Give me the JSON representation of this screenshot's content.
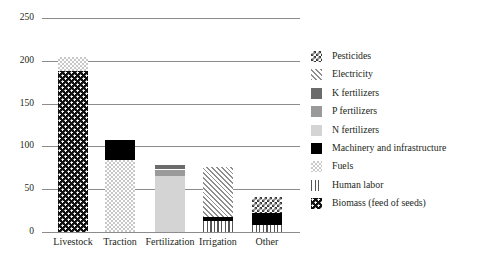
{
  "chart_data": {
    "type": "bar",
    "stacked": true,
    "title": "",
    "xlabel": "",
    "ylabel": "",
    "ylim": [
      0,
      250
    ],
    "yticks": [
      0,
      50,
      100,
      150,
      200,
      250
    ],
    "ytick_labels": [
      "0",
      "50",
      "100",
      "150",
      "200",
      "250"
    ],
    "grid": true,
    "legend_position": "right",
    "categories": [
      "Livestock",
      "Traction",
      "Fertilization",
      "Irrigation",
      "Other"
    ],
    "series": [
      {
        "name": "Pesticides",
        "values": [
          0,
          0,
          0,
          0,
          19
        ]
      },
      {
        "name": "Electricity",
        "values": [
          0,
          0,
          0,
          59,
          0
        ]
      },
      {
        "name": "K fertilizers",
        "values": [
          0,
          0,
          5,
          0,
          0
        ]
      },
      {
        "name": "P fertilizers",
        "values": [
          0,
          0,
          8,
          0,
          0
        ]
      },
      {
        "name": "N fertilizers",
        "values": [
          0,
          0,
          65,
          0,
          0
        ]
      },
      {
        "name": "Machinery and infrastructure",
        "values": [
          0,
          23,
          0,
          4,
          14
        ]
      },
      {
        "name": "Fuels",
        "values": [
          16,
          84,
          0,
          0,
          0
        ]
      },
      {
        "name": "Human labor",
        "values": [
          0,
          0,
          0,
          13,
          8
        ]
      },
      {
        "name": "Biomass (feed of seeds)",
        "values": [
          188,
          0,
          0,
          0,
          0
        ]
      }
    ],
    "totals": [
      204,
      107,
      78,
      76,
      41
    ]
  },
  "legend": {
    "items": [
      {
        "label": "Pesticides",
        "pattern": "pesticides",
        "color": "#3a3a3a"
      },
      {
        "label": "Electricity",
        "pattern": "electricity",
        "color": "#8e8e8e"
      },
      {
        "label": "K fertilizers",
        "pattern": "kfert",
        "color": "#6b6b6b"
      },
      {
        "label": "P fertilizers",
        "pattern": "pfert",
        "color": "#9a9a9a"
      },
      {
        "label": "N fertilizers",
        "pattern": "nfert",
        "color": "#d4d4d4"
      },
      {
        "label": "Machinery and infrastructure",
        "pattern": "machinery",
        "color": "#000000"
      },
      {
        "label": "Fuels",
        "pattern": "fuels",
        "color": "#c9c9c9"
      },
      {
        "label": "Human labor",
        "pattern": "humanlabor",
        "color": "#555555"
      },
      {
        "label": "Biomass (feed of seeds)",
        "pattern": "biomass",
        "color": "#111111"
      }
    ]
  },
  "axis": {
    "ticks": [
      {
        "value": 250,
        "label": "250"
      },
      {
        "value": 200,
        "label": "200"
      },
      {
        "value": 150,
        "label": "150"
      },
      {
        "value": 100,
        "label": "100"
      },
      {
        "value": 50,
        "label": "50"
      },
      {
        "value": 0,
        "label": "0"
      }
    ]
  },
  "bars": [
    {
      "name": "Livestock",
      "segments": [
        {
          "series": "Biomass (feed of seeds)",
          "from": 0,
          "to": 188
        },
        {
          "series": "Fuels",
          "from": 188,
          "to": 204
        }
      ]
    },
    {
      "name": "Traction",
      "segments": [
        {
          "series": "Fuels",
          "from": 0,
          "to": 84
        },
        {
          "series": "Machinery and infrastructure",
          "from": 84,
          "to": 107
        }
      ]
    },
    {
      "name": "Fertilization",
      "segments": [
        {
          "series": "N fertilizers",
          "from": 0,
          "to": 65
        },
        {
          "series": "P fertilizers",
          "from": 65,
          "to": 73
        },
        {
          "series": "K fertilizers",
          "from": 73,
          "to": 78
        }
      ]
    },
    {
      "name": "Irrigation",
      "segments": [
        {
          "series": "Human labor",
          "from": 0,
          "to": 13
        },
        {
          "series": "Machinery and infrastructure",
          "from": 13,
          "to": 17
        },
        {
          "series": "Electricity",
          "from": 17,
          "to": 76
        }
      ]
    },
    {
      "name": "Other",
      "segments": [
        {
          "series": "Human labor",
          "from": 0,
          "to": 8
        },
        {
          "series": "Machinery and infrastructure",
          "from": 8,
          "to": 22
        },
        {
          "series": "Pesticides",
          "from": 22,
          "to": 41
        }
      ]
    }
  ]
}
